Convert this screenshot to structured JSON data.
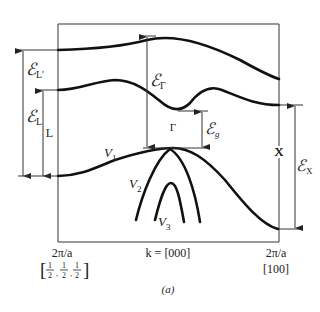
{
  "figure": {
    "caption": "(a)",
    "colors": {
      "line": "#111111",
      "text": "#222222",
      "background": "#ffffff"
    }
  },
  "labels": {
    "E_Lprime": {
      "script": "ℰ",
      "sub": "L'"
    },
    "E_L": {
      "script": "ℰ",
      "sub": "L"
    },
    "E_Gamma": {
      "script": "ℰ",
      "sub": "Γ"
    },
    "E_g": {
      "script": "ℰ",
      "sub": "g"
    },
    "E_X": {
      "script": "ℰ",
      "sub": "X"
    },
    "L_point": "L",
    "X_point": "X",
    "Gamma_point": "Γ",
    "V1": {
      "main": "V",
      "sub": "1"
    },
    "V2": {
      "main": "V",
      "sub": "2"
    },
    "V3": {
      "main": "V",
      "sub": "3"
    }
  },
  "axis": {
    "left_top": "2π/a",
    "left_bottom": "[½,½,½]",
    "left_frac": [
      "1",
      "2"
    ],
    "center": "k = [000]",
    "right_top": "2π/a",
    "right_bottom": "[100]"
  }
}
